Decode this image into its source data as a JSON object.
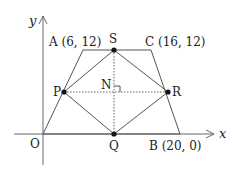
{
  "figure": {
    "axes": {
      "x_label": "x",
      "y_label": "y",
      "origin_label": "O"
    },
    "points": {
      "A": {
        "label": "A (6,  12)",
        "name": "A",
        "coords": [
          6,
          12
        ]
      },
      "C": {
        "label": "C (16,  12)",
        "name": "C",
        "coords": [
          16,
          12
        ]
      },
      "B": {
        "label": "B (20,  0)",
        "name": "B",
        "coords": [
          20,
          0
        ]
      },
      "O": {
        "label": "O",
        "coords": [
          0,
          0
        ]
      },
      "S": {
        "label": "S"
      },
      "P": {
        "label": "P"
      },
      "Q": {
        "label": "Q"
      },
      "R": {
        "label": "R"
      },
      "N": {
        "label": "N"
      }
    },
    "shapes": {
      "trapezoid": "OACB",
      "rhombus": "PSRQ",
      "dotted_segments": [
        "SQ",
        "PR"
      ],
      "right_angle_at": "N"
    },
    "colors": {
      "line": "#555555",
      "point": "#111111",
      "text": "#222222"
    }
  }
}
